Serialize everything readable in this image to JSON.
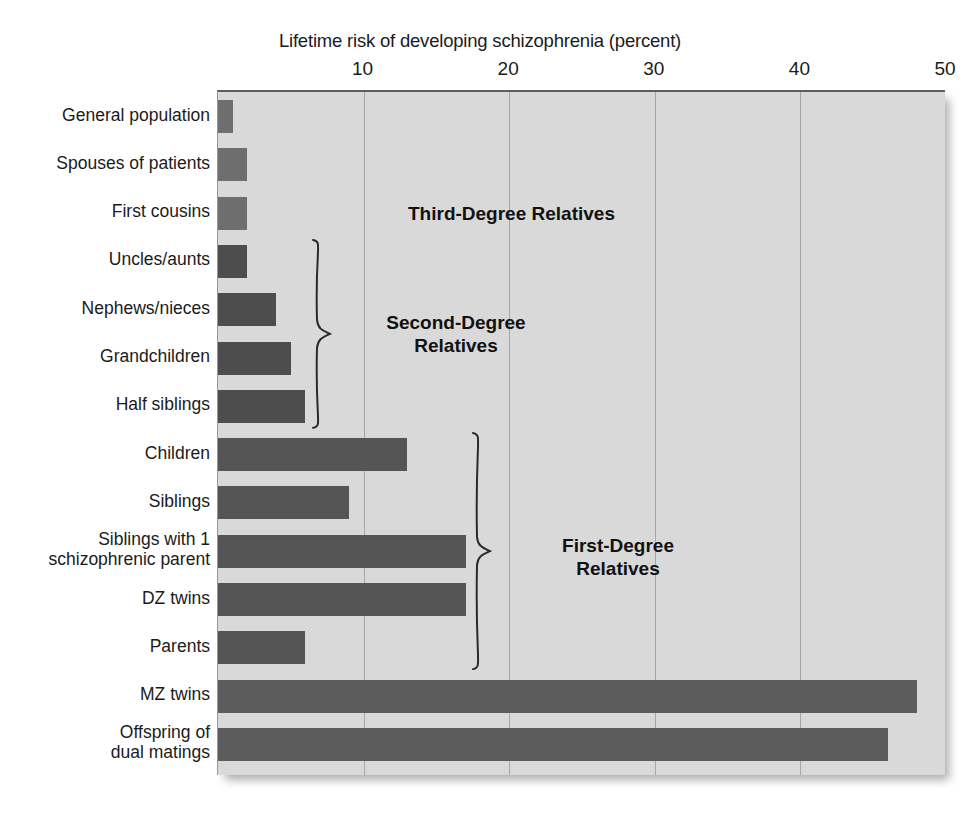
{
  "chart_data": {
    "type": "bar",
    "orientation": "horizontal",
    "title": "Lifetime risk of developing schizophrenia (percent)",
    "xlabel": "",
    "ylabel": "",
    "xlim": [
      0,
      50
    ],
    "xticks": [
      10,
      20,
      30,
      40,
      50
    ],
    "xtick_labels": [
      "10",
      "20",
      "30",
      "40",
      "50"
    ],
    "grid": "vertical",
    "legend": "none",
    "categories": [
      "General population",
      "Spouses of patients",
      "First cousins",
      "Uncles/aunts",
      "Nephews/nieces",
      "Grandchildren",
      "Half siblings",
      "Children",
      "Siblings",
      "Siblings with 1 schizophrenic parent",
      "DZ twins",
      "Parents",
      "MZ twins",
      "Offspring of dual matings"
    ],
    "category_lines": [
      [
        "General population"
      ],
      [
        "Spouses of patients"
      ],
      [
        "First cousins"
      ],
      [
        "Uncles/aunts"
      ],
      [
        "Nephews/nieces"
      ],
      [
        "Grandchildren"
      ],
      [
        "Half siblings"
      ],
      [
        "Children"
      ],
      [
        "Siblings"
      ],
      [
        "Siblings with 1",
        "schizophrenic parent"
      ],
      [
        "DZ twins"
      ],
      [
        "Parents"
      ],
      [
        "MZ twins"
      ],
      [
        "Offspring of",
        "dual matings"
      ]
    ],
    "values": [
      1,
      2,
      2,
      2,
      4,
      5,
      6,
      13,
      9,
      17,
      17,
      6,
      48,
      46
    ],
    "bar_colors": [
      "#6e6e6e",
      "#6e6e6e",
      "#6e6e6e",
      "#4d4d4d",
      "#4d4d4d",
      "#4d4d4d",
      "#4d4d4d",
      "#555555",
      "#555555",
      "#555555",
      "#555555",
      "#555555",
      "#5c5c5c",
      "#5c5c5c"
    ],
    "annotations": [
      {
        "id": "third-degree",
        "lines": [
          "Third-Degree Relatives"
        ],
        "covers": [
          "First cousins"
        ],
        "has_brace": false
      },
      {
        "id": "second-degree",
        "lines": [
          "Second-Degree",
          "Relatives"
        ],
        "covers": [
          "Uncles/aunts",
          "Nephews/nieces",
          "Grandchildren",
          "Half siblings"
        ],
        "has_brace": true
      },
      {
        "id": "first-degree",
        "lines": [
          "First-Degree",
          "Relatives"
        ],
        "covers": [
          "Children",
          "Siblings",
          "Siblings with 1 schizophrenic parent",
          "DZ twins",
          "Parents"
        ],
        "has_brace": true
      }
    ],
    "colors": {
      "plot_background": "#d9d9d9",
      "gridline": "#a6a6a6",
      "axis": "#5d5d5d",
      "text": "#1b1b1b",
      "page_background": "#ffffff"
    }
  }
}
